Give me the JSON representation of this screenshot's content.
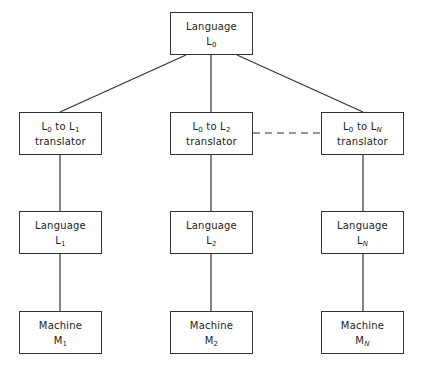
{
  "diagram": {
    "type": "tree",
    "root": {
      "id": "language-l0",
      "line1": "Language",
      "symbol": "L",
      "sub": "0"
    },
    "columns": [
      {
        "translator": {
          "from_symbol": "L",
          "from_sub": "0",
          "connector": "to",
          "to_symbol": "L",
          "to_sub": "1",
          "line2": "translator"
        },
        "language": {
          "line1": "Language",
          "symbol": "L",
          "sub": "1"
        },
        "machine": {
          "line1": "Machine",
          "symbol": "M",
          "sub": "1"
        }
      },
      {
        "translator": {
          "from_symbol": "L",
          "from_sub": "0",
          "connector": "to",
          "to_symbol": "L",
          "to_sub": "2",
          "line2": "translator"
        },
        "language": {
          "line1": "Language",
          "symbol": "L",
          "sub": "2"
        },
        "machine": {
          "line1": "Machine",
          "symbol": "M",
          "sub": "2"
        }
      },
      {
        "translator": {
          "from_symbol": "L",
          "from_sub": "0",
          "connector": "to",
          "to_symbol": "L",
          "to_sub": "N",
          "line2": "translator"
        },
        "language": {
          "line1": "Language",
          "symbol": "L",
          "sub": "N"
        },
        "machine": {
          "line1": "Machine",
          "symbol": "M",
          "sub": "N"
        }
      }
    ],
    "edges": [
      {
        "from": "Language L0",
        "to": "L0 to L1 translator",
        "style": "solid"
      },
      {
        "from": "Language L0",
        "to": "L0 to L2 translator",
        "style": "solid"
      },
      {
        "from": "Language L0",
        "to": "L0 to LN translator",
        "style": "solid"
      },
      {
        "from": "L0 to L1 translator",
        "to": "Language L1",
        "style": "solid"
      },
      {
        "from": "L0 to L2 translator",
        "to": "Language L2",
        "style": "solid"
      },
      {
        "from": "L0 to LN translator",
        "to": "Language LN",
        "style": "solid"
      },
      {
        "from": "Language L1",
        "to": "Machine M1",
        "style": "solid"
      },
      {
        "from": "Language L2",
        "to": "Machine M2",
        "style": "solid"
      },
      {
        "from": "Language LN",
        "to": "Machine MN",
        "style": "solid"
      },
      {
        "from": "L0 to L2 translator",
        "to": "L0 to LN translator",
        "style": "dashed"
      }
    ],
    "colors": {
      "stroke": "#333333",
      "background": "#ffffff",
      "text": "#222222"
    }
  }
}
